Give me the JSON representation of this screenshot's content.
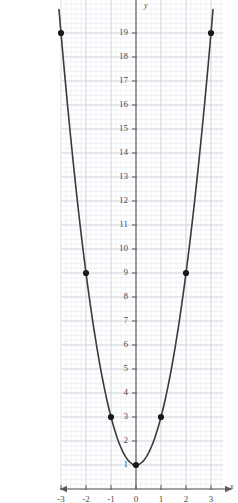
{
  "chart_data": {
    "type": "line",
    "title": "",
    "xlabel": "x",
    "ylabel": "y",
    "equation": "y = 2x^2 + 1",
    "grid": true,
    "minor_grid": true,
    "legend": "none",
    "xlim": [
      -3.3,
      3.3
    ],
    "ylim": [
      0.2,
      19.6
    ],
    "xticks": [
      -3,
      -2,
      -1,
      0,
      1,
      2,
      3
    ],
    "xticklabels": [
      "-3",
      "-2",
      "-1",
      "0",
      "1",
      "2",
      "3"
    ],
    "yticks": [
      1,
      2,
      3,
      4,
      5,
      6,
      7,
      8,
      9,
      10,
      11,
      12,
      13,
      14,
      15,
      16,
      17,
      18,
      19
    ],
    "yticklabels": [
      "1",
      "2",
      "3",
      "4",
      "5",
      "6",
      "7",
      "8",
      "9",
      "10",
      "11",
      "12",
      "13",
      "14",
      "15",
      "16",
      "17",
      "18",
      "19"
    ],
    "x": [
      -3,
      -2,
      -1,
      0,
      1,
      2,
      3
    ],
    "values": [
      19,
      9,
      3,
      1,
      3,
      9,
      19
    ],
    "marked_points": [
      {
        "x": -3,
        "y": 19
      },
      {
        "x": -2,
        "y": 9
      },
      {
        "x": -1,
        "y": 3
      },
      {
        "x": 0,
        "y": 1
      },
      {
        "x": 1,
        "y": 3
      },
      {
        "x": 2,
        "y": 9
      },
      {
        "x": 3,
        "y": 19
      }
    ],
    "curve_color": "#3a3a3a",
    "point_color": "#1a1a1a",
    "grid_color": "#c9ccd6",
    "minor_grid_color": "#e3e5ec",
    "axis_color": "#5a5a5a",
    "background": "#ffffff"
  },
  "axes": {
    "x_axis_label": "x",
    "y_axis_label": "y"
  }
}
